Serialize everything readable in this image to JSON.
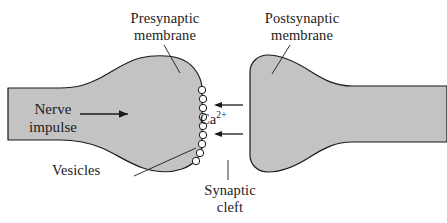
{
  "figure": {
    "type": "biology-diagram",
    "background_color": "#ffffff",
    "cell_fill_color": "#c3c3c3",
    "outline_color": "#1a1a1a",
    "text_color": "#1c1c1c",
    "vesicle_fill_color": "#ffffff"
  },
  "labels": {
    "presynaptic_membrane": "Presynaptic\nmembrane",
    "postsynaptic_membrane": "Postsynaptic\nmembrane",
    "nerve_impulse": "Nerve\nimpulse",
    "vesicles": "Vesicles",
    "synaptic_cleft": "Synaptic\ncleft",
    "calcium_symbol": "Ca",
    "calcium_charge": "2+"
  },
  "elements": {
    "presynaptic_neuron_name": "presynaptic-neuron-body",
    "postsynaptic_neuron_name": "postsynaptic-neuron-body",
    "vesicle_count": 9,
    "calcium_arrow_count": 2,
    "impulse_arrow_direction": "right",
    "calcium_arrow_direction": "left"
  }
}
